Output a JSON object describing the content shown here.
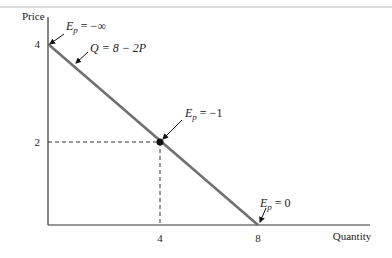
{
  "chart_data": {
    "type": "line",
    "title": "",
    "xlabel": "Quantity",
    "ylabel": "Price",
    "xlim": [
      0,
      8
    ],
    "ylim": [
      0,
      4
    ],
    "x_ticks": [
      "4",
      "8"
    ],
    "y_ticks": [
      "2",
      "4"
    ],
    "grid": false,
    "series": [
      {
        "name": "Q = 8 − 2P",
        "points": [
          [
            0,
            4
          ],
          [
            8,
            0
          ]
        ]
      }
    ],
    "marked_point": {
      "x": 4,
      "y": 2,
      "label": "E_p = −1"
    },
    "guides": {
      "x": 4,
      "y": 2,
      "style": "dashed"
    },
    "annotations": [
      {
        "target": [
          0,
          4
        ],
        "text_main": "E",
        "text_sub": "p",
        "text_rest": " = −∞"
      },
      {
        "target": [
          2,
          3
        ],
        "text_main": "Q = 8 − 2P",
        "text_sub": "",
        "text_rest": ""
      },
      {
        "target": [
          4,
          2
        ],
        "text_main": "E",
        "text_sub": "p",
        "text_rest": " = −1"
      },
      {
        "target": [
          8,
          0
        ],
        "text_main": "E",
        "text_sub": "p",
        "text_rest": " = 0"
      }
    ],
    "line_color": "#707070",
    "axis_color": "#333333"
  }
}
